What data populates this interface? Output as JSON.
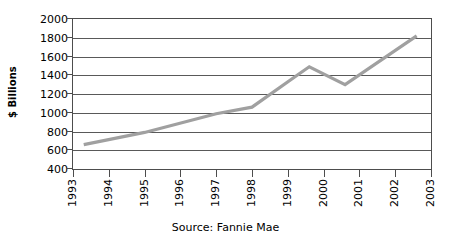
{
  "chart_data": {
    "type": "line",
    "title": "",
    "xlabel": "",
    "ylabel": "$ Billions",
    "source": "Source: Fannie Mae",
    "grid": true,
    "legend": false,
    "xlim": [
      1993,
      2003
    ],
    "ylim": [
      400,
      2000
    ],
    "ytick_labels": [
      "2000",
      "1800",
      "1600",
      "1400",
      "1200",
      "1000",
      "800",
      "600",
      "400"
    ],
    "ytick_values": [
      2000,
      1800,
      1600,
      1400,
      1200,
      1000,
      800,
      600,
      400
    ],
    "xtick_labels": [
      "1993",
      "1994",
      "1995",
      "1996",
      "1997",
      "1998",
      "1999",
      "2000",
      "2001",
      "2002",
      "2003"
    ],
    "xtick_values": [
      1993,
      1994,
      1995,
      1996,
      1997,
      1998,
      1999,
      2000,
      2001,
      2002,
      2003
    ],
    "series": [
      {
        "name": "$ Billions",
        "color": "#a0a0a0",
        "x": [
          1993.3,
          1995.0,
          1997.0,
          1998.0,
          1999.3,
          1999.6,
          2000.6,
          2002.6
        ],
        "values": [
          660,
          790,
          990,
          1060,
          1410,
          1490,
          1300,
          1820
        ]
      }
    ],
    "annotations": []
  },
  "axis": {
    "y_title": "$ Billions"
  },
  "caption": {
    "source_text": "Source: Fannie Mae"
  },
  "style": {
    "line_color": "#a0a0a0",
    "grid_color": "#595959",
    "frame_color": "#4d4d4d",
    "text_color": "#000000",
    "background": "#ffffff"
  }
}
